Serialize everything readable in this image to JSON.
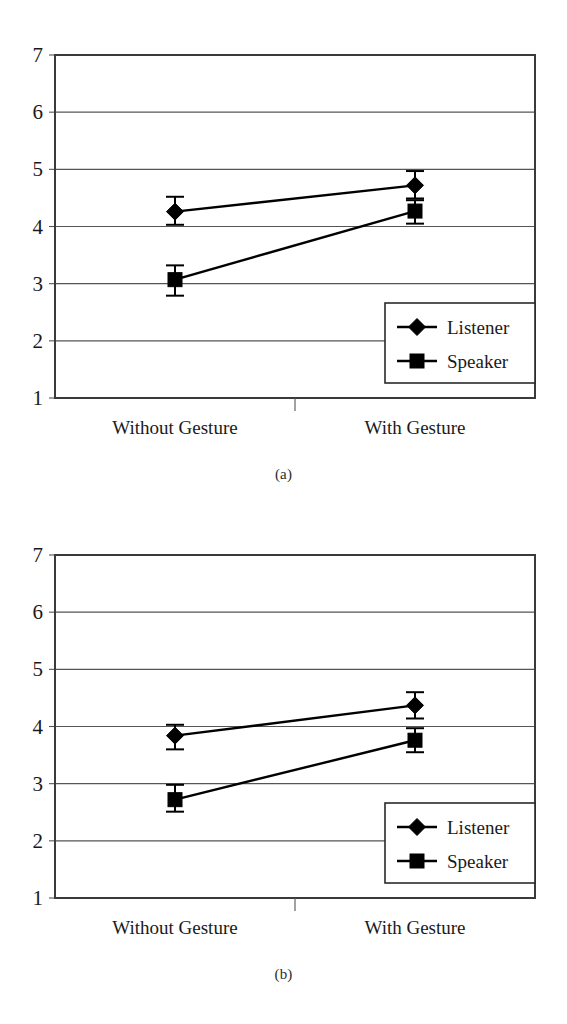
{
  "figure": {
    "panels": [
      {
        "caption": "(a)",
        "caption_name": "caption-a"
      },
      {
        "caption": "(b)",
        "caption_name": "caption-b"
      }
    ]
  },
  "chart_data": [
    {
      "type": "line",
      "panel": "(a)",
      "title": "",
      "xlabel": "",
      "ylabel": "",
      "categories": [
        "Without Gesture",
        "With Gesture"
      ],
      "ylim": [
        1,
        7
      ],
      "yticks": [
        1,
        2,
        3,
        4,
        5,
        6,
        7
      ],
      "ytick_labels": [
        "1",
        "2",
        "3",
        "4",
        "5",
        "6",
        "7"
      ],
      "grid": true,
      "legend_position": "bottom-right",
      "series": [
        {
          "name": "Listener",
          "marker": "diamond",
          "values": [
            4.26,
            4.72
          ],
          "err_low": [
            4.03,
            4.49
          ],
          "err_high": [
            4.52,
            4.97
          ]
        },
        {
          "name": "Speaker",
          "marker": "square",
          "values": [
            3.07,
            4.27
          ],
          "err_low": [
            2.79,
            4.05
          ],
          "err_high": [
            3.32,
            4.46
          ]
        }
      ]
    },
    {
      "type": "line",
      "panel": "(b)",
      "title": "",
      "xlabel": "",
      "ylabel": "",
      "categories": [
        "Without Gesture",
        "With Gesture"
      ],
      "ylim": [
        1,
        7
      ],
      "yticks": [
        1,
        2,
        3,
        4,
        5,
        6,
        7
      ],
      "ytick_labels": [
        "1",
        "2",
        "3",
        "4",
        "5",
        "6",
        "7"
      ],
      "grid": true,
      "legend_position": "bottom-right",
      "series": [
        {
          "name": "Listener",
          "marker": "diamond",
          "values": [
            3.84,
            4.37
          ],
          "err_low": [
            3.6,
            4.14
          ],
          "err_high": [
            4.03,
            4.6
          ]
        },
        {
          "name": "Speaker",
          "marker": "square",
          "values": [
            2.72,
            3.76
          ],
          "err_low": [
            2.51,
            3.55
          ],
          "err_high": [
            2.98,
            3.97
          ]
        }
      ]
    }
  ],
  "axis": {
    "ytick_labels": [
      "7",
      "6",
      "5",
      "4",
      "3",
      "2",
      "1"
    ],
    "xtick_labels": [
      "Without Gesture",
      "With Gesture"
    ]
  },
  "legend": {
    "items": [
      {
        "label": "Listener",
        "marker": "diamond"
      },
      {
        "label": "Speaker",
        "marker": "square"
      }
    ]
  },
  "colors": {
    "ink": "#000000",
    "grid": "#555555",
    "axis": "#3a3a3a",
    "background": "#ffffff"
  }
}
